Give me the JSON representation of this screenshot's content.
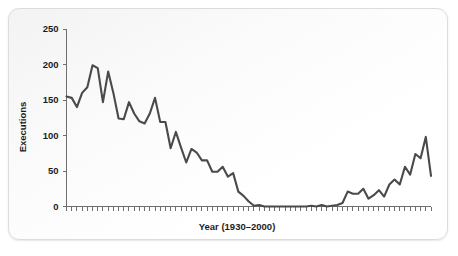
{
  "figure": {
    "accent_color": "#4a4a4a",
    "axis_color": "#6e6e6e",
    "card_background": "#fbfbfb"
  },
  "chart_data": {
    "type": "line",
    "title": "",
    "xlabel": "Year (1930–2000)",
    "ylabel": "Executions",
    "xlim": [
      1930,
      2000
    ],
    "ylim": [
      0,
      250
    ],
    "yticks": [
      0,
      50,
      100,
      150,
      200,
      250
    ],
    "ytick_labels": [
      "0",
      "50",
      "100",
      "150",
      "200",
      "250"
    ],
    "xticks_every": 1,
    "xtick_labels_shown": false,
    "grid": false,
    "legend": null,
    "series": [
      {
        "name": "Executions",
        "color": "#4a4a4a",
        "x": [
          1930,
          1931,
          1932,
          1933,
          1934,
          1935,
          1936,
          1937,
          1938,
          1939,
          1940,
          1941,
          1942,
          1943,
          1944,
          1945,
          1946,
          1947,
          1948,
          1949,
          1950,
          1951,
          1952,
          1953,
          1954,
          1955,
          1956,
          1957,
          1958,
          1959,
          1960,
          1961,
          1962,
          1963,
          1964,
          1965,
          1966,
          1967,
          1968,
          1969,
          1970,
          1971,
          1972,
          1973,
          1974,
          1975,
          1976,
          1977,
          1978,
          1979,
          1980,
          1981,
          1982,
          1983,
          1984,
          1985,
          1986,
          1987,
          1988,
          1989,
          1990,
          1991,
          1992,
          1993,
          1994,
          1995,
          1996,
          1997,
          1998,
          1999,
          2000
        ],
        "values": [
          155,
          153,
          140,
          160,
          168,
          199,
          195,
          147,
          190,
          160,
          124,
          123,
          147,
          131,
          120,
          117,
          131,
          153,
          119,
          119,
          82,
          105,
          83,
          62,
          81,
          76,
          65,
          65,
          49,
          49,
          56,
          42,
          47,
          21,
          15,
          7,
          1,
          2,
          0,
          0,
          0,
          0,
          0,
          0,
          0,
          0,
          0,
          1,
          0,
          2,
          0,
          1,
          2,
          5,
          21,
          18,
          18,
          25,
          11,
          16,
          23,
          14,
          31,
          38,
          31,
          56,
          45,
          74,
          68,
          98,
          43
        ]
      }
    ]
  }
}
